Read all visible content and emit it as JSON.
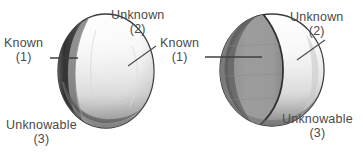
{
  "figure": {
    "title": "",
    "background_color": "#ffffff",
    "ink_color": "#4a4a4a",
    "known_fill_color": "#9a9a9a",
    "unknown_fill_color": "#ffffff",
    "outline_color": "#3a3a3a"
  },
  "spheres": [
    {
      "id": "sphere-left",
      "description": "sphere with a thin dark crescent on the left edge",
      "known_fraction_label": "small",
      "labels": {
        "known": {
          "text": "Known",
          "number": "(1)"
        },
        "unknown": {
          "text": "Unknown",
          "number": "(2)"
        },
        "unknowable": {
          "text": "Unknowable",
          "number": "(3)"
        }
      }
    },
    {
      "id": "sphere-right",
      "description": "sphere with a large shaded region covering the left portion",
      "known_fraction_label": "large",
      "labels": {
        "known": {
          "text": "Known",
          "number": "(1)"
        },
        "unknown": {
          "text": "Unknown",
          "number": "(2)"
        },
        "unknowable": {
          "text": "Unknowable",
          "number": "(3)"
        }
      }
    }
  ]
}
